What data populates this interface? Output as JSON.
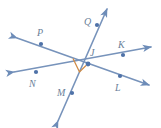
{
  "figure": {
    "kind": "geometry-line-diagram",
    "background_color": "#ffffff",
    "line_color": "#7793bb",
    "line_color_dark": "#5c7cae",
    "point_color": "#4f72a8",
    "label_color": "#6b7f99",
    "right_angle_color": "#d08b46",
    "center": {
      "name": "J",
      "x": 88,
      "y": 64
    },
    "labels": [
      {
        "id": "label-P",
        "text": "P",
        "x": 37,
        "y": 28
      },
      {
        "id": "label-Q",
        "text": "Q",
        "x": 84,
        "y": 17
      },
      {
        "id": "label-K",
        "text": "K",
        "x": 118,
        "y": 40
      },
      {
        "id": "label-J",
        "text": "J",
        "x": 90,
        "y": 48
      },
      {
        "id": "label-N",
        "text": "N",
        "x": 29,
        "y": 79
      },
      {
        "id": "label-M",
        "text": "M",
        "x": 57,
        "y": 88
      },
      {
        "id": "label-L",
        "text": "L",
        "x": 115,
        "y": 83
      }
    ],
    "points": [
      {
        "id": "point-P",
        "name": "P",
        "x": 41,
        "y": 44
      },
      {
        "id": "point-Q",
        "name": "Q",
        "x": 97,
        "y": 25
      },
      {
        "id": "point-K",
        "name": "K",
        "x": 123,
        "y": 55
      },
      {
        "id": "point-J",
        "name": "J",
        "x": 88,
        "y": 64
      },
      {
        "id": "point-N",
        "name": "N",
        "x": 36,
        "y": 72
      },
      {
        "id": "point-M",
        "name": "M",
        "x": 72,
        "y": 93
      },
      {
        "id": "point-L",
        "name": "L",
        "x": 120,
        "y": 76
      }
    ],
    "lines": [
      {
        "id": "line-PL",
        "name": "line-P-L",
        "through": [
          "P",
          "J",
          "L"
        ],
        "x1": 17,
        "y1": 38,
        "x2": 149,
        "y2": 85,
        "arrow_start": true,
        "arrow_end": true
      },
      {
        "id": "line-NK",
        "name": "line-N-K",
        "through": [
          "N",
          "J",
          "K"
        ],
        "x1": 14,
        "y1": 72,
        "x2": 151,
        "y2": 47,
        "arrow_start": true,
        "arrow_end": true
      },
      {
        "id": "line-MQ",
        "name": "line-M-Q",
        "through": [
          "M",
          "J",
          "Q"
        ],
        "x1": 58,
        "y1": 121,
        "x2": 107,
        "y2": 9,
        "arrow_start": true,
        "arrow_end": true
      }
    ],
    "right_angle": {
      "id": "right-angle-marker",
      "label": "right angle at J between line NK and line MQ",
      "points": "72,59 78,72 84,66",
      "color": "#d08b46"
    }
  }
}
